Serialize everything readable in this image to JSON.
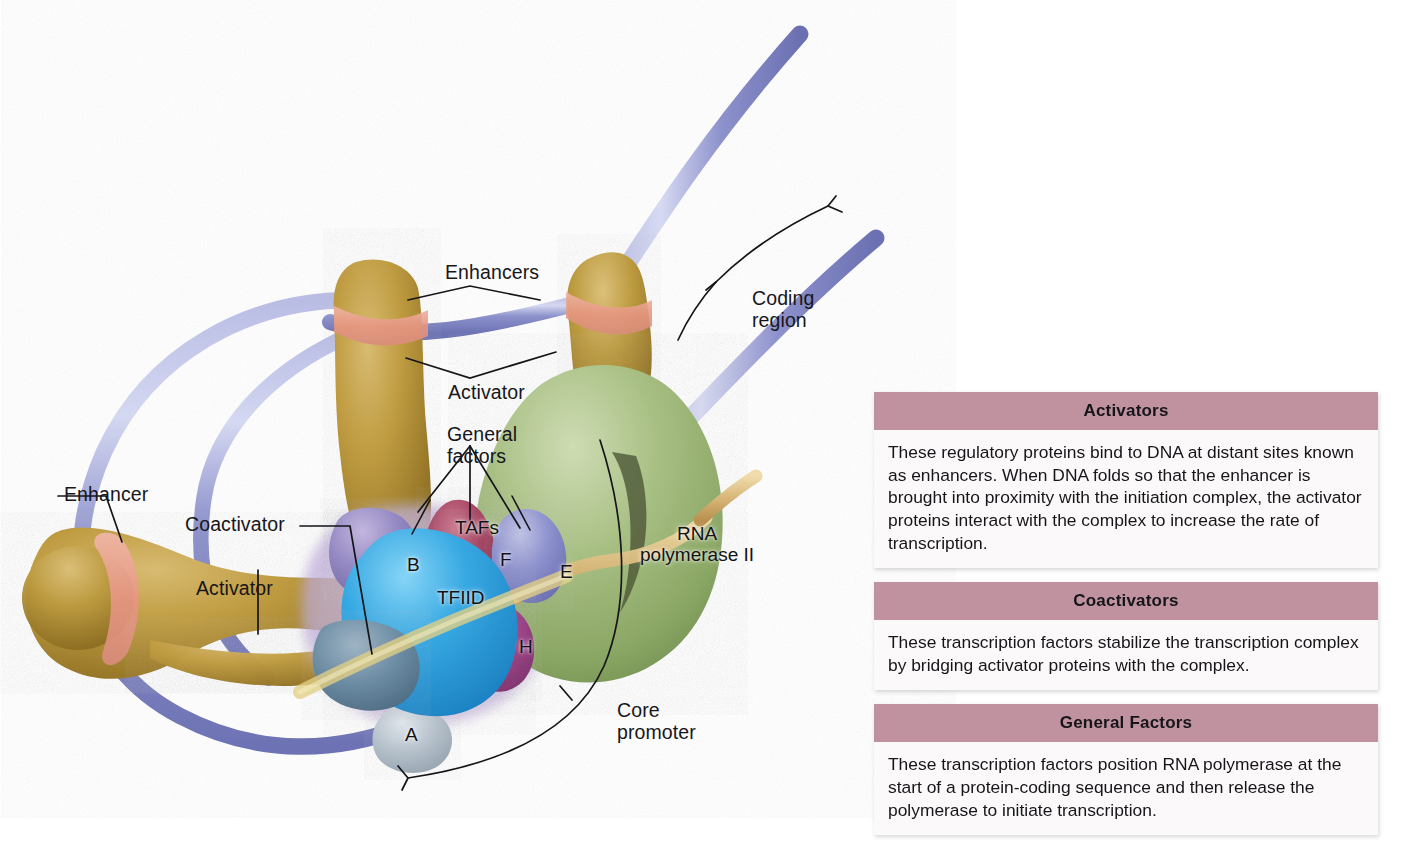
{
  "figure": {
    "background": "#ffffff"
  },
  "diagram_labels": {
    "enhancers_top": "Enhancers",
    "activator_top": "Activator",
    "general_factors": "General\nfactors",
    "coding_region": "Coding\nregion",
    "enhancer_left": "Enhancer",
    "coactivator": "Coactivator",
    "activator_left": "Activator",
    "core_promoter": "Core\npromoter"
  },
  "complex_subunits": {
    "tafs": "TAFs",
    "b": "B",
    "f": "F",
    "e": "E",
    "h": "H",
    "a": "A",
    "tfiid": "TFIID",
    "rna_pol": "RNA\npolymerase II"
  },
  "colors": {
    "dna": "#8e93cf",
    "activator_protein": "#b08a32",
    "enhancer_site": "#e8a394",
    "rna_polymerase": "#9ab37a",
    "tfiid": "#3fa8e0",
    "coactivator": "#6f8ea6",
    "tfiib": "#8a7ab5",
    "tfiif": "#a8445f",
    "tfiie": "#8b8fc6",
    "tfiih": "#a44b8c",
    "tbp_a": "#b9c3cc",
    "panel_header": "#c0929f",
    "panel_body": "#fbf9f9",
    "nascent_strand": "#d9b87a"
  },
  "panels": [
    {
      "id": "activators",
      "title": "Activators",
      "body": "These regulatory proteins bind to DNA at distant sites known as enhancers. When DNA folds so that the enhancer is brought into proximity with the initiation complex, the activator proteins interact with the complex to increase the rate of transcription."
    },
    {
      "id": "coactivators",
      "title": "Coactivators",
      "body": "These transcription factors stabilize the transcription complex by bridging activator proteins with the complex."
    },
    {
      "id": "general-factors",
      "title": "General Factors",
      "body": "These transcription factors position RNA polymerase at the start of a protein-coding sequence and then release the polymerase to initiate transcription."
    }
  ]
}
